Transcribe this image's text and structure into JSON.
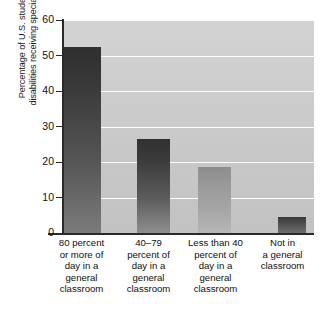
{
  "chart_data": {
    "type": "bar",
    "title": "",
    "xlabel": "",
    "ylabel": "Percentage of U.S. students with disabilities receiving special services",
    "ylabel_lines": [
      "Percentage of U.S. students with",
      "disabilities receiving special services"
    ],
    "categories": [
      "80 percent or more of day in a general classroom",
      "40–79 percent of day in a general classroom",
      "Less than 40 percent of day in a general classroom",
      "Not in a general classroom"
    ],
    "category_lines": [
      [
        "80 percent",
        "or more of",
        "day in a",
        "general",
        "classroom"
      ],
      [
        "40–79",
        "percent of",
        "day in a",
        "general",
        "classroom"
      ],
      [
        "Less than 40",
        "percent of",
        "day in a",
        "general",
        "classroom"
      ],
      [
        "Not in",
        "a general",
        "classroom"
      ]
    ],
    "values": [
      52.4,
      26.5,
      18.6,
      4.5
    ],
    "ylim": [
      0,
      60
    ],
    "yticks": [
      0,
      10,
      20,
      30,
      40,
      50,
      60
    ],
    "ytick_labels": [
      "0",
      "10",
      "20",
      "30",
      "40",
      "50",
      "60"
    ],
    "grid": true,
    "grid_axis": "y",
    "grid_color": "#fdfdfd",
    "legend": false,
    "plot_background": "#cccccc",
    "bar_colors": [
      "#3a3a3a",
      "#3d3d3d",
      "#9a9a9a",
      "#4d4d4d"
    ],
    "axis_color": "#2a2a2a"
  }
}
